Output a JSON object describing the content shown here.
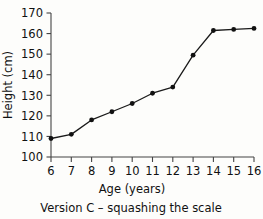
{
  "chart_data": {
    "type": "line",
    "title": "",
    "caption": "Version C – squashing the scale",
    "xlabel": "Age (years)",
    "ylabel": "Height (cm)",
    "x": [
      6,
      7,
      8,
      9,
      10,
      11,
      12,
      13,
      14,
      15,
      16
    ],
    "values": [
      109,
      111,
      118,
      122,
      126,
      131,
      134,
      149.5,
      161.5,
      162,
      162.5
    ],
    "categories": [
      "6",
      "7",
      "8",
      "9",
      "10",
      "11",
      "12",
      "13",
      "14",
      "15",
      "16"
    ],
    "xtick_labels": [
      "6",
      "7",
      "8",
      "9",
      "10",
      "11",
      "12",
      "13",
      "14",
      "15",
      "16"
    ],
    "ytick_labels": [
      "100",
      "110",
      "120",
      "130",
      "140",
      "150",
      "160",
      "170"
    ],
    "yticks": [
      100,
      110,
      120,
      130,
      140,
      150,
      160,
      170
    ],
    "xlim": [
      6,
      16
    ],
    "ylim": [
      100,
      170
    ],
    "grid": false,
    "legend": false,
    "legend_position": "none",
    "marker": "filled-circle",
    "line_color": "#111111",
    "marker_color": "#111111",
    "axis_color": "#444444",
    "background_color": "#fdfdfb"
  }
}
